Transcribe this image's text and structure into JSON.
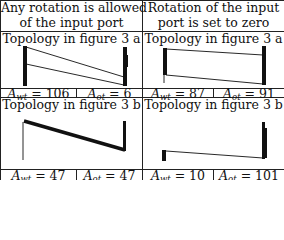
{
  "columns": [
    {
      "header": [
        "Any rotation is allowed",
        "of the input port"
      ],
      "cases": [
        {
          "topology_label": "Topology in figure 3 a",
          "A_wt_label": "A",
          "A_wt_sub": "wt",
          "A_wt_value": "= 106",
          "A_ot_label": "A",
          "A_ot_sub": "ot",
          "A_ot_value": "= 6"
        },
        {
          "topology_label": "Topology in figure 3 b",
          "A_wt_label": "A",
          "A_wt_sub": "wt",
          "A_wt_value": "= 47",
          "A_ot_label": "A",
          "A_ot_sub": "ot",
          "A_ot_value": "= 47"
        }
      ]
    },
    {
      "header": [
        "Rotation of the input",
        "port is set to zero"
      ],
      "cases": [
        {
          "topology_label": "Topology in figure 3 a",
          "A_wt_label": "A",
          "A_wt_sub": "wt",
          "A_wt_value": "= 87",
          "A_ot_label": "A",
          "A_ot_sub": "ot",
          "A_ot_value": "= 91"
        },
        {
          "topology_label": "Topology in figure 3 b",
          "A_wt_label": "A",
          "A_wt_sub": "wt",
          "A_wt_value": "= 10",
          "A_ot_label": "A",
          "A_ot_sub": "ot",
          "A_ot_value": "= 101"
        }
      ]
    }
  ]
}
